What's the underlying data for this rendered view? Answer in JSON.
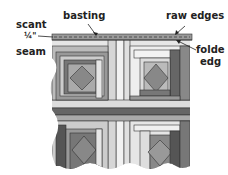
{
  "labels": {
    "scant": "scant",
    "quarter": "¼\"",
    "seam": "seam",
    "basting": "basting",
    "raw_edges": "raw edges",
    "folded": "folde",
    "edge": "edg"
  },
  "colors": {
    "dark": "#555555",
    "mid_dark": "#777777",
    "mid": "#999999",
    "light": "#c8c8c8",
    "very_light": "#e6e6e6",
    "outline": "#333333"
  }
}
